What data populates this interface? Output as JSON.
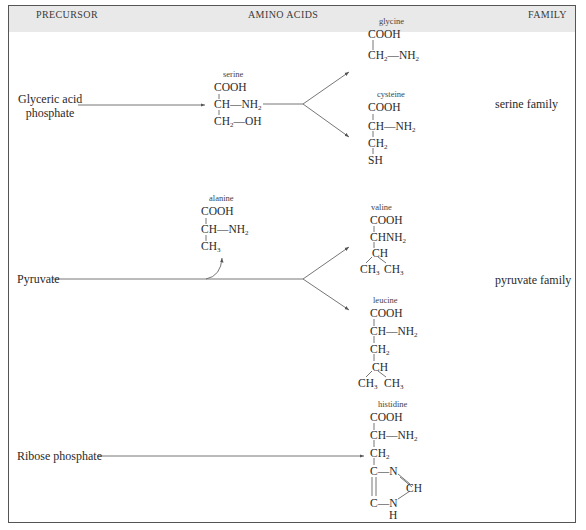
{
  "header": {
    "precursor": "PRECURSOR",
    "amino_acids": "AMINO  ACIDS",
    "family": "FAMILY"
  },
  "precursors": [
    {
      "label_line1": "Glyceric acid",
      "label_line2": "phosphate"
    },
    {
      "label": "Pyruvate"
    },
    {
      "label": "Ribose phosphate"
    }
  ],
  "families": [
    {
      "label": "serine family"
    },
    {
      "label": "pyruvate family"
    }
  ],
  "amino_acids": {
    "serine": {
      "name": "serine",
      "lines": [
        "COOH",
        "CH—NH",
        "CH",
        "—OH"
      ]
    },
    "glycine": {
      "name": "glycine",
      "lines": [
        "COOH",
        "CH",
        "—NH"
      ]
    },
    "cysteine": {
      "name": "cysteine",
      "lines": [
        "COOH",
        "CH—NH",
        "CH",
        "SH"
      ]
    },
    "alanine": {
      "name": "alanine",
      "lines": [
        "COOH",
        "CH—NH",
        "CH"
      ]
    },
    "valine": {
      "name": "valine",
      "lines": [
        "COOH",
        "CHNH",
        "CH",
        "CH",
        "CH"
      ]
    },
    "leucine": {
      "name": "leucine",
      "lines": [
        "COOH",
        "CH—NH",
        "CH",
        "CH",
        "CH",
        "CH"
      ]
    },
    "histidine": {
      "name": "histidine",
      "lines": [
        "COOH",
        "CH—NH",
        "CH",
        "C—N",
        "CH",
        "C—N",
        "H"
      ]
    }
  },
  "subscripts": {
    "two": "2",
    "three": "3"
  },
  "colors": {
    "header_bg": "#e9e9e9",
    "border": "#555555",
    "text": "#2a2a2a"
  }
}
